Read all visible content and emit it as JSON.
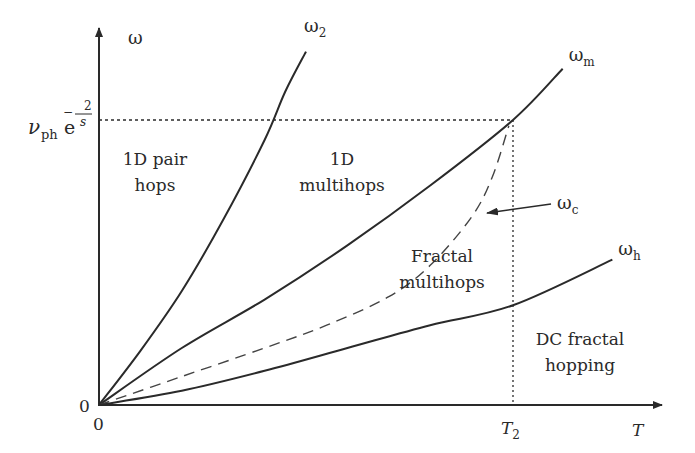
{
  "chart_data": {
    "type": "line",
    "title": "",
    "xlabel": "T",
    "ylabel": "ω",
    "x_unit": "T / T2",
    "y_unit": "ω / (ν_ph e^(-2/s))",
    "xlim": [
      0,
      1.24
    ],
    "ylim": [
      0,
      1.3
    ],
    "grid": false,
    "legend": "none",
    "x_ticks": [
      {
        "value": 0,
        "label": "0"
      },
      {
        "value": 1,
        "label": "T",
        "sub": "2"
      }
    ],
    "y_ticks": [
      {
        "value": 0,
        "label": "0"
      },
      {
        "value": 1,
        "label_main": "ν",
        "label_sub": "ph",
        "label_exp_e": "e",
        "label_exp_num": "2",
        "label_exp_den": "s",
        "label_exp_sign": "−"
      }
    ],
    "reference_lines": [
      {
        "name": "omega-level",
        "orientation": "horizontal",
        "value": 1,
        "from_x": 0,
        "to_x": 1,
        "style": "dotted"
      },
      {
        "name": "T2-level",
        "orientation": "vertical",
        "value": 1,
        "from_y": 0,
        "to_y": 1,
        "style": "dotted"
      }
    ],
    "series": [
      {
        "name": "ω2",
        "label_main": "ω",
        "label_sub": "2",
        "style": "solid",
        "x": [
          0,
          0.1,
          0.2,
          0.3,
          0.4,
          0.45,
          0.5
        ],
        "y": [
          0,
          0.19,
          0.4,
          0.65,
          0.93,
          1.1,
          1.24
        ]
      },
      {
        "name": "ωm",
        "label_main": "ω",
        "label_sub": "m",
        "style": "solid",
        "x": [
          0,
          0.2,
          0.4,
          0.6,
          0.8,
          1.0,
          1.12
        ],
        "y": [
          0,
          0.2,
          0.37,
          0.56,
          0.77,
          1.0,
          1.18
        ]
      },
      {
        "name": "ωc",
        "label_main": "ω",
        "label_sub": "c",
        "style": "dashed",
        "x": [
          0,
          0.2,
          0.4,
          0.55,
          0.7,
          0.8,
          0.9,
          0.95,
          0.99
        ],
        "y": [
          0,
          0.1,
          0.2,
          0.28,
          0.38,
          0.49,
          0.66,
          0.8,
          0.98
        ]
      },
      {
        "name": "ωh",
        "label_main": "ω",
        "label_sub": "h",
        "style": "solid",
        "x": [
          0,
          0.2,
          0.4,
          0.6,
          0.8,
          1.0,
          1.24
        ],
        "y": [
          0,
          0.05,
          0.12,
          0.2,
          0.28,
          0.35,
          0.51
        ]
      }
    ],
    "annotations": [
      {
        "name": "region-1d-pair-hops",
        "lines": [
          "1D pair",
          "hops"
        ]
      },
      {
        "name": "region-1d-multihops",
        "lines": [
          "1D",
          "multihops"
        ]
      },
      {
        "name": "region-fractal-multihops",
        "lines": [
          "Fractal",
          "multihops"
        ]
      },
      {
        "name": "region-dc-fractal-hopping",
        "lines": [
          "DC fractal",
          "hopping"
        ]
      }
    ],
    "arrow_annotation": {
      "label_main": "ω",
      "label_sub": "c",
      "points_to": "ωc"
    }
  }
}
